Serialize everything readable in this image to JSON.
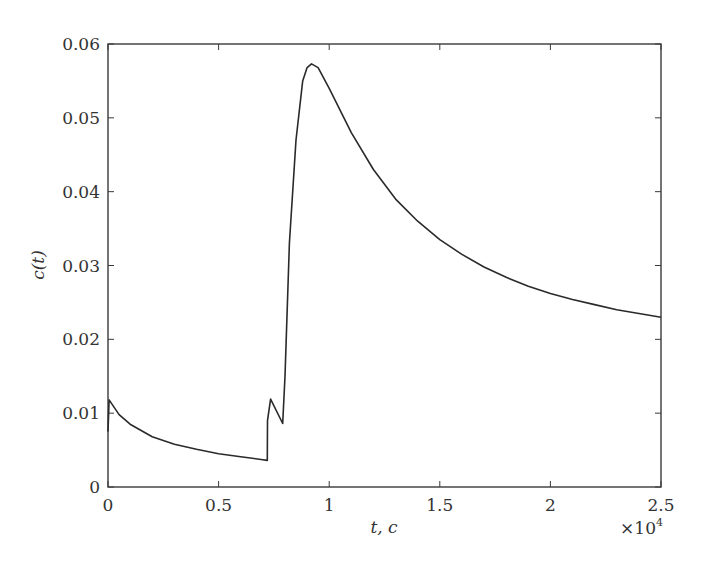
{
  "chart_data": {
    "type": "line",
    "title": "",
    "xlabel": "t, c",
    "ylabel": "c(t)",
    "x_multiplier_label": "×10",
    "x_multiplier_exp": "4",
    "xlim": [
      0,
      2.5
    ],
    "ylim": [
      0,
      0.06
    ],
    "grid": false,
    "legend": null,
    "xticks": [
      0,
      0.5,
      1,
      1.5,
      2,
      2.5
    ],
    "xtick_labels": [
      "0",
      "0.5",
      "1",
      "1.5",
      "2",
      "2.5"
    ],
    "yticks": [
      0,
      0.01,
      0.02,
      0.03,
      0.04,
      0.05,
      0.06
    ],
    "ytick_labels": [
      "0",
      "0.01",
      "0.02",
      "0.03",
      "0.04",
      "0.05",
      "0.06"
    ],
    "series": [
      {
        "name": "c(t)",
        "color": "#2a2a2a",
        "x": [
          0,
          0.005,
          0.05,
          0.1,
          0.2,
          0.3,
          0.4,
          0.5,
          0.6,
          0.7,
          0.72,
          0.721,
          0.735,
          0.79,
          0.8,
          0.82,
          0.85,
          0.88,
          0.9,
          0.92,
          0.95,
          1.0,
          1.1,
          1.2,
          1.3,
          1.4,
          1.5,
          1.6,
          1.7,
          1.8,
          1.9,
          2.0,
          2.1,
          2.2,
          2.3,
          2.4,
          2.5
        ],
        "y": [
          0.0075,
          0.0118,
          0.0098,
          0.0085,
          0.0068,
          0.0058,
          0.0051,
          0.0045,
          0.0041,
          0.0037,
          0.0036,
          0.009,
          0.0119,
          0.0086,
          0.015,
          0.033,
          0.047,
          0.055,
          0.0568,
          0.0573,
          0.0568,
          0.054,
          0.048,
          0.043,
          0.039,
          0.036,
          0.0335,
          0.0315,
          0.0298,
          0.0284,
          0.0272,
          0.0262,
          0.0254,
          0.0247,
          0.024,
          0.0235,
          0.023
        ]
      }
    ]
  },
  "layout": {
    "plot_left": 108,
    "plot_right": 661,
    "plot_top": 44,
    "plot_bottom": 487
  }
}
